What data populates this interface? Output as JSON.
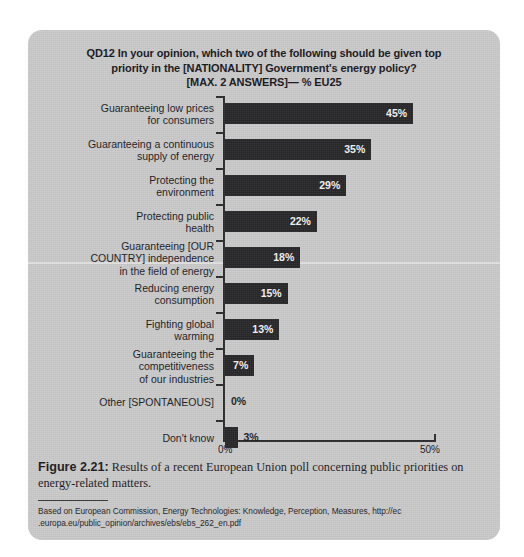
{
  "chart_data": {
    "type": "bar",
    "orientation": "horizontal",
    "title": "QD12 In your opinion, which two of the following should be given top priority in the [NATIONALITY] Government's energy policy? [MAX. 2 ANSWERS]— % EU25",
    "title_lines": [
      "QD12 In your opinion, which two of the following should be given top",
      "priority in the [NATIONALITY] Government's energy policy?",
      "[MAX. 2 ANSWERS]— % EU25"
    ],
    "xlabel": "",
    "ylabel": "",
    "xlim": [
      0,
      50
    ],
    "grid": false,
    "legend": null,
    "tick_labels": [
      "0%",
      "50%"
    ],
    "categories": [
      "Guaranteeing low prices for consumers",
      "Guaranteeing a continuous supply of energy",
      "Protecting the environment",
      "Protecting public health",
      "Guaranteeing [OUR COUNTRY] independence in the field of energy",
      "Reducing energy consumption",
      "Fighting global warming",
      "Guaranteeing the competitiveness of our industries",
      "Other [SPONTANEOUS]",
      "Don't know"
    ],
    "values": [
      45,
      35,
      29,
      22,
      18,
      15,
      13,
      7,
      0,
      3
    ],
    "value_labels": [
      "45%",
      "35%",
      "29%",
      "22%",
      "18%",
      "15%",
      "13%",
      "7%",
      "0%",
      "3%"
    ],
    "bar_color": "#262628",
    "background_color": "#c9c9c9",
    "bars": [
      {
        "label_lines": [
          "Guaranteeing low prices",
          "for consumers"
        ],
        "value": 45,
        "value_label": "45%",
        "label_position": "inside"
      },
      {
        "label_lines": [
          "Guaranteeing a continuous",
          "supply of energy"
        ],
        "value": 35,
        "value_label": "35%",
        "label_position": "inside"
      },
      {
        "label_lines": [
          "Protecting the",
          "environment"
        ],
        "value": 29,
        "value_label": "29%",
        "label_position": "inside"
      },
      {
        "label_lines": [
          "Protecting public",
          "health"
        ],
        "value": 22,
        "value_label": "22%",
        "label_position": "inside"
      },
      {
        "label_lines": [
          "Guaranteeing [OUR",
          "COUNTRY] independence",
          "in the field of energy"
        ],
        "value": 18,
        "value_label": "18%",
        "label_position": "inside"
      },
      {
        "label_lines": [
          "Reducing energy",
          "consumption"
        ],
        "value": 15,
        "value_label": "15%",
        "label_position": "inside"
      },
      {
        "label_lines": [
          "Fighting global",
          "warming"
        ],
        "value": 13,
        "value_label": "13%",
        "label_position": "inside"
      },
      {
        "label_lines": [
          "Guaranteeing the",
          "competitiveness",
          "of our industries"
        ],
        "value": 7,
        "value_label": "7%",
        "label_position": "inside"
      },
      {
        "label_lines": [
          "Other [SPONTANEOUS]"
        ],
        "value": 0,
        "value_label": "0%",
        "label_position": "outside"
      },
      {
        "label_lines": [
          "Don't know"
        ],
        "value": 3,
        "value_label": "3%",
        "label_position": "outside"
      }
    ]
  },
  "caption": {
    "figure_number": "Figure 2.21:",
    "text": " Results of a recent European Union poll concerning public priorities on energy-related matters."
  },
  "source": {
    "text": "Based on European Commission, Energy Technologies:  Knowledge, Perception, Measures, http://ec .europa.eu/public_opinion/archives/ebs/ebs_262_en.pdf"
  }
}
